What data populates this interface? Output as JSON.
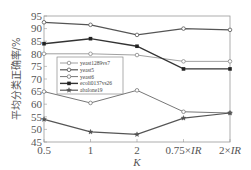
{
  "chart_data": {
    "type": "line",
    "title": "",
    "xlabel": "K",
    "ylabel": "平均分类正确率/%",
    "categories": [
      "0.5",
      "1",
      "2",
      "0.75×IR",
      "2×IR"
    ],
    "ylim": [
      45,
      95
    ],
    "yticks": [
      45,
      50,
      55,
      60,
      65,
      70,
      75,
      80,
      85,
      90,
      95
    ],
    "grid": false,
    "legend_position": "center-left inside",
    "series": [
      {
        "name": "yeast1289vs7",
        "marker": "open-circle",
        "values": [
          80,
          80,
          79.5,
          77,
          77
        ]
      },
      {
        "name": "yeast5",
        "marker": "open-circle",
        "values": [
          92.5,
          91.5,
          87.5,
          90,
          89.5
        ]
      },
      {
        "name": "yeast6",
        "marker": "open-circle",
        "values": [
          65,
          60.5,
          65.5,
          57,
          56.5
        ]
      },
      {
        "name": "ecoli0137vs26",
        "marker": "filled-square",
        "values": [
          84,
          86,
          83,
          74,
          74
        ]
      },
      {
        "name": "abalone19",
        "marker": "star",
        "values": [
          54,
          49,
          48,
          54.5,
          56.5
        ]
      }
    ]
  },
  "axis": {
    "x_label": "K",
    "x_ticks": [
      "0.5",
      "1",
      "2",
      "0.75×",
      "2×"
    ],
    "x_ticks_italic": [
      "",
      "",
      "",
      "IR",
      "IR"
    ],
    "y_label": "平均分类正确率/%",
    "y_ticks": [
      "95",
      "90",
      "85",
      "80",
      "75",
      "70",
      "65",
      "60",
      "55",
      "50",
      "45"
    ]
  },
  "legend": {
    "items": [
      "yeast1289vs7",
      "yeast5",
      "yeast6",
      "ecoli0137vs26",
      "abalone19"
    ]
  }
}
